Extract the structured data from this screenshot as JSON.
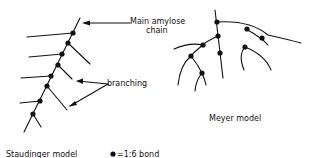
{
  "diagram": {
    "labels": {
      "main_chain_line1": "Main amylose",
      "main_chain_line2": "chain",
      "branching": "branching",
      "meyer": "Meyer model",
      "staudinger": "Staudinger model",
      "legend": "=1:6 bond"
    },
    "colors": {
      "ink": "#111111",
      "background": "#ffffff"
    }
  }
}
